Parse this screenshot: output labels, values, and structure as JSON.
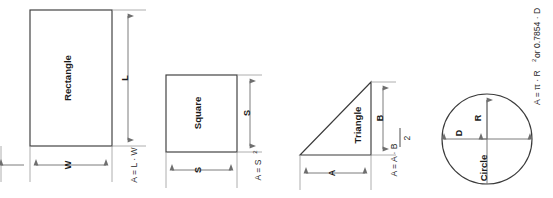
{
  "page": {
    "background_color": "#ffffff",
    "width": 553,
    "height": 198,
    "orientation_note": "rotated-90-ccw",
    "stroke_color": "#3b3b3b",
    "dimension_color": "#6e6e6e"
  },
  "figures": [
    {
      "id": "rectangle",
      "name": "Rectangle",
      "shape_type": "rectangle",
      "formula": "A = L · W",
      "formula_parts": {
        "lhs": "A = L · W",
        "base": "",
        "sup": ""
      },
      "dimensions": [
        {
          "label": "L",
          "orientation": "vertical"
        },
        {
          "label": "W",
          "orientation": "horizontal"
        }
      ]
    },
    {
      "id": "square",
      "name": "Square",
      "shape_type": "square",
      "formula": "A = S²",
      "formula_parts": {
        "lhs": "A = S",
        "base": "S",
        "sup": "2"
      },
      "dimensions": [
        {
          "label": "S",
          "orientation": "vertical"
        },
        {
          "label": "S",
          "orientation": "horizontal"
        }
      ]
    },
    {
      "id": "triangle",
      "name": "Triangle",
      "shape_type": "right-triangle",
      "formula": "A = A · B / 2",
      "formula_parts": {
        "numerator": "A = A · B",
        "denominator": "2"
      },
      "dimensions": [
        {
          "label": "B",
          "orientation": "vertical"
        },
        {
          "label": "A",
          "orientation": "horizontal"
        }
      ]
    },
    {
      "id": "circle",
      "name": "Circle",
      "shape_type": "circle",
      "formula": "A = π · R² or 0.7854 · D²",
      "formula_parts": {
        "seg1": "A = π · R",
        "sup1": "2",
        "seg2": " or 0.7854 · D",
        "sup2": "2"
      },
      "dimensions": [
        {
          "label": "R",
          "orientation": "radius"
        },
        {
          "label": "D",
          "orientation": "diameter"
        }
      ]
    }
  ]
}
